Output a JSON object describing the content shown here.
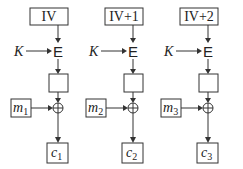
{
  "diagram": {
    "type": "CTR mode encryption",
    "key_label": "K",
    "encrypt_label": "E",
    "xor_symbol": "⊕",
    "columns": [
      {
        "counter": "IV",
        "message": "m",
        "message_sub": "1",
        "cipher": "c",
        "cipher_sub": "1"
      },
      {
        "counter": "IV+1",
        "message": "m",
        "message_sub": "2",
        "cipher": "c",
        "cipher_sub": "2"
      },
      {
        "counter": "IV+2",
        "message": "m",
        "message_sub": "3",
        "cipher": "c",
        "cipher_sub": "3"
      }
    ]
  }
}
